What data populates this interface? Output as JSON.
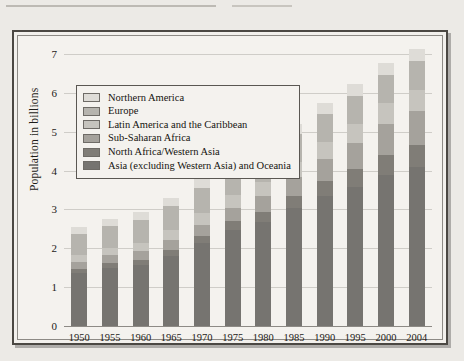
{
  "page": {
    "background_color": "#eceae6",
    "rule_color": "#bdbab4"
  },
  "figure": {
    "frame_color": "#4b4843",
    "plot_background": "#f4f2ee",
    "gridline_color": "#cfcdc8"
  },
  "legend": {
    "position": "inside-top-left",
    "border_color": "#5a5752",
    "entries": [
      {
        "label": "Northern America",
        "color": "#dedcd7"
      },
      {
        "label": "Europe",
        "color": "#b6b4ae"
      },
      {
        "label": "Latin America and the Caribbean",
        "color": "#c6c4be"
      },
      {
        "label": "Sub-Saharan Africa",
        "color": "#a5a29c"
      },
      {
        "label": "North Africa/Western Asia",
        "color": "#807d77"
      },
      {
        "label": "Asia (excluding Western Asia) and Oceania",
        "color": "#767470"
      }
    ]
  },
  "chart_data": {
    "type": "bar",
    "title": "",
    "subtitle": "",
    "stacked": true,
    "xlabel": "",
    "ylabel": "Population in billions",
    "ylim": [
      0,
      7
    ],
    "yticks": [
      0,
      1,
      2,
      3,
      4,
      5,
      6,
      7
    ],
    "ytick_labels": [
      "0",
      "1",
      "2",
      "3",
      "4",
      "5",
      "6",
      "7"
    ],
    "grid": true,
    "legend_position": "upper left",
    "categories": [
      "1950",
      "1955",
      "1960",
      "1965",
      "1970",
      "1975",
      "1980",
      "1985",
      "1990",
      "1995",
      "2000",
      "2004"
    ],
    "series": [
      {
        "name": "Asia (excluding Western Asia) and Oceania",
        "color": "#767470",
        "values": [
          1.36,
          1.5,
          1.56,
          1.8,
          2.13,
          2.48,
          2.68,
          3.03,
          3.35,
          3.59,
          3.89,
          4.08
        ]
      },
      {
        "name": "North Africa/Western Asia",
        "color": "#807d77",
        "values": [
          0.11,
          0.12,
          0.14,
          0.16,
          0.19,
          0.22,
          0.26,
          0.32,
          0.38,
          0.45,
          0.52,
          0.57
        ]
      },
      {
        "name": "Sub-Saharan Africa",
        "color": "#a5a29c",
        "values": [
          0.18,
          0.2,
          0.22,
          0.25,
          0.29,
          0.34,
          0.4,
          0.48,
          0.57,
          0.68,
          0.8,
          0.88
        ]
      },
      {
        "name": "Latin America and the Caribbean",
        "color": "#c6c4be",
        "values": [
          0.17,
          0.19,
          0.22,
          0.25,
          0.29,
          0.32,
          0.36,
          0.4,
          0.44,
          0.48,
          0.52,
          0.55
        ]
      },
      {
        "name": "Europe",
        "color": "#b6b4ae",
        "values": [
          0.55,
          0.57,
          0.6,
          0.63,
          0.66,
          0.68,
          0.69,
          0.7,
          0.72,
          0.73,
          0.73,
          0.73
        ]
      },
      {
        "name": "Northern America",
        "color": "#dedcd7",
        "values": [
          0.17,
          0.18,
          0.2,
          0.21,
          0.23,
          0.24,
          0.25,
          0.27,
          0.28,
          0.3,
          0.32,
          0.33
        ]
      }
    ],
    "totals": [
      2.46,
      2.69,
      2.95,
      3.22,
      3.55,
      4.04,
      4.45,
      4.9,
      5.35,
      5.74,
      6.11,
      6.26
    ]
  }
}
